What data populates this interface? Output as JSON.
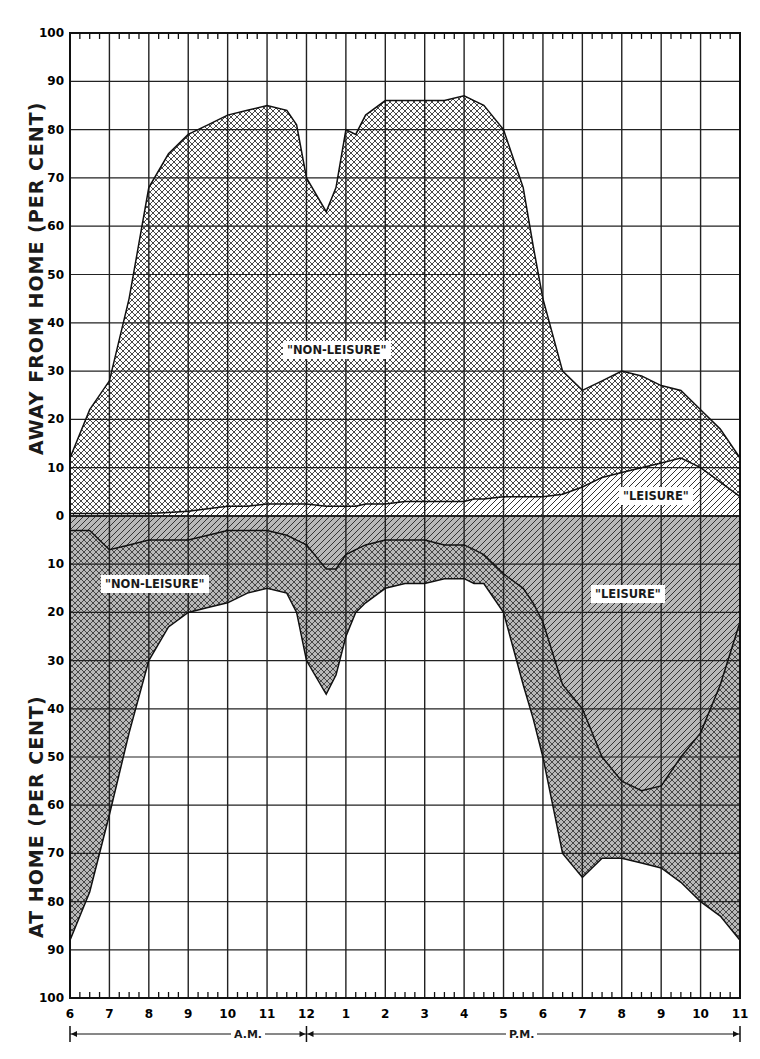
{
  "chart_data": {
    "type": "area",
    "title": "",
    "xlabel": "Hour of day (A.M. 6–12, P.M. 12–11)",
    "ylabel_top": "AWAY FROM HOME (PER CENT)",
    "ylabel_bottom": "AT HOME (PER CENT)",
    "x_tick_labels": [
      "6",
      "7",
      "8",
      "9",
      "10",
      "11",
      "12",
      "1",
      "2",
      "3",
      "4",
      "5",
      "6",
      "7",
      "8",
      "9",
      "10",
      "11"
    ],
    "y_tick_labels_top": [
      "100",
      "90",
      "80",
      "70",
      "60",
      "50",
      "40",
      "30",
      "20",
      "10",
      "0"
    ],
    "y_tick_labels_bottom": [
      "10",
      "20",
      "30",
      "40",
      "50",
      "60",
      "70",
      "80",
      "90",
      "100"
    ],
    "am_label": "A.M.",
    "pm_label": "P.M.",
    "ylim_top": [
      0,
      100
    ],
    "ylim_bottom": [
      0,
      100
    ],
    "grid": true,
    "x_hours": [
      0,
      0.5,
      1,
      1.5,
      2,
      2.5,
      3,
      3.5,
      4,
      4.5,
      5,
      5.5,
      5.75,
      6,
      6.5,
      6.75,
      7,
      7.25,
      7.5,
      8,
      8.5,
      9,
      9.5,
      10,
      10.25,
      10.5,
      11,
      11.5,
      11.75,
      12,
      12.5,
      13,
      13.5,
      14,
      14.5,
      15,
      15.5,
      16,
      16.5,
      17
    ],
    "series": [
      {
        "name": "Away from home — total (non-leisure + leisure)",
        "values": [
          12,
          22,
          28,
          45,
          68,
          75,
          79,
          81,
          83,
          84,
          85,
          84,
          81,
          70,
          63,
          68,
          80,
          79,
          83,
          86,
          86,
          86,
          86,
          87,
          86,
          85,
          80,
          68,
          56,
          45,
          30,
          26,
          28,
          30,
          29,
          27,
          26,
          22,
          18,
          12
        ]
      },
      {
        "name": "Away from home — leisure",
        "values": [
          0.5,
          0.5,
          0.5,
          0.5,
          0.5,
          0.7,
          1,
          1.5,
          2,
          2,
          2.5,
          2.5,
          2.5,
          2.5,
          2,
          2,
          2,
          2,
          2.5,
          2.5,
          3,
          3,
          3,
          3,
          3.5,
          3.5,
          4,
          4,
          4,
          4,
          4.5,
          6,
          8,
          9,
          10,
          11,
          12,
          10,
          7,
          4
        ]
      },
      {
        "name": "At home — leisure (depth below zero)",
        "values": [
          3,
          3,
          7,
          6,
          5,
          5,
          5,
          4,
          3,
          3,
          3,
          4,
          5,
          6,
          11,
          11,
          8,
          7,
          6,
          5,
          5,
          5,
          6,
          6,
          7,
          8,
          12,
          15,
          18,
          22,
          35,
          40,
          50,
          55,
          57,
          56,
          50,
          45,
          35,
          22
        ]
      },
      {
        "name": "At home — total (non-leisure + leisure, depth below zero)",
        "values": [
          88,
          78,
          62,
          45,
          30,
          23,
          20,
          19,
          18,
          16,
          15,
          16,
          20,
          30,
          37,
          33,
          25,
          20,
          18,
          15,
          14,
          14,
          13,
          13,
          14,
          14,
          20,
          35,
          42,
          50,
          70,
          75,
          71,
          71,
          72,
          73,
          76,
          80,
          83,
          88
        ]
      }
    ],
    "annotations": [
      {
        "text": "\"NON-LEISURE\"",
        "region": "away"
      },
      {
        "text": "\"LEISURE\"",
        "region": "away"
      },
      {
        "text": "\"NON-LEISURE\"",
        "region": "home"
      },
      {
        "text": "\"LEISURE\"",
        "region": "home"
      }
    ]
  },
  "labels": {
    "away_nonleisure": "\"NON-LEISURE\"",
    "away_leisure": "\"LEISURE\"",
    "home_nonleisure": "\"NON-LEISURE\"",
    "home_leisure": "\"LEISURE\"",
    "ylabel_top": "AWAY  FROM  HOME  (PER  CENT)",
    "ylabel_bottom": "AT  HOME  (PER  CENT)",
    "am": "A.M.",
    "pm": "P.M."
  }
}
